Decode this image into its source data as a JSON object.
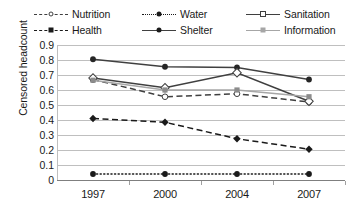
{
  "chart_data": {
    "type": "line",
    "title": "",
    "xlabel": "",
    "ylabel": "Censored headcount",
    "categories": [
      "1997",
      "2000",
      "2004",
      "2007"
    ],
    "ylim": [
      0,
      0.9
    ],
    "ytick_labels": [
      "0.9",
      "0.8",
      "0.7",
      "0.6",
      "0.5",
      "0.4",
      "0.3",
      "0.2",
      "0.1",
      "0"
    ],
    "ytick_values": [
      0.9,
      0.8,
      0.7,
      0.6,
      0.5,
      0.4,
      0.3,
      0.2,
      0.1,
      0
    ],
    "grid": true,
    "legend_position": "top",
    "series": [
      {
        "name": "Nutrition",
        "values": [
          0.67,
          0.555,
          0.575,
          0.52
        ],
        "line": "dashed",
        "marker": "open-circle",
        "color": "#3f3f3f"
      },
      {
        "name": "Health",
        "values": [
          0.41,
          0.385,
          0.275,
          0.205
        ],
        "line": "dashed",
        "marker": "filled-diamond",
        "color": "#1a1a1a"
      },
      {
        "name": "Water",
        "values": [
          0.04,
          0.04,
          0.04,
          0.04
        ],
        "line": "dotted",
        "marker": "filled-circle",
        "color": "#1a1a1a"
      },
      {
        "name": "Shelter",
        "values": [
          0.805,
          0.755,
          0.75,
          0.67
        ],
        "line": "solid",
        "marker": "filled-circle",
        "color": "#404040"
      },
      {
        "name": "Sanitation",
        "values": [
          0.68,
          0.615,
          0.715,
          0.525
        ],
        "line": "solid",
        "marker": "open-diamond",
        "color": "#3f3f3f"
      },
      {
        "name": "Information",
        "values": [
          0.665,
          0.6,
          0.6,
          0.555
        ],
        "line": "solid",
        "marker": "gray-square",
        "color": "#a6a6a6"
      }
    ]
  },
  "legend": {
    "items": [
      {
        "label": "Nutrition",
        "icon": "dashed-open-circle-icon"
      },
      {
        "label": "Health",
        "icon": "dashed-filled-diamond-icon"
      },
      {
        "label": "Water",
        "icon": "dotted-filled-circle-icon"
      },
      {
        "label": "Shelter",
        "icon": "solid-filled-circle-icon"
      },
      {
        "label": "Sanitation",
        "icon": "solid-open-diamond-icon"
      },
      {
        "label": "Information",
        "icon": "solid-gray-square-icon"
      }
    ]
  }
}
